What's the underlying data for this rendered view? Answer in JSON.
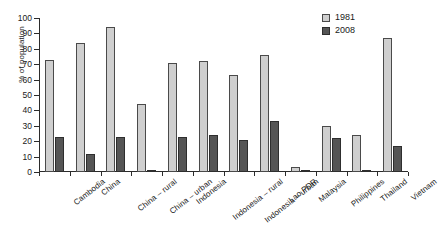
{
  "chart_data": {
    "type": "bar",
    "title": "",
    "xlabel": "",
    "ylabel": "% of population",
    "ylim": [
      0,
      100
    ],
    "ytick_step": 10,
    "grid": false,
    "legend_position": "top-right",
    "categories": [
      "Cambodia",
      "China",
      "China – rural",
      "China – urban",
      "Indonesia",
      "Indonesia – rural",
      "Indonesia – urban",
      "Lao PDR",
      "Malaysia",
      "Philippines",
      "Thailand",
      "Vietnam"
    ],
    "ytick_labels": [
      "0",
      "10",
      "20",
      "30",
      "40",
      "50",
      "60",
      "70",
      "80",
      "90",
      "100"
    ],
    "series": [
      {
        "name": "1981",
        "color": "#cfcfcf",
        "values": [
          73,
          84,
          94,
          44,
          71,
          72,
          63,
          76,
          3,
          30,
          24,
          87
        ]
      },
      {
        "name": "2008",
        "color": "#555555",
        "values": [
          23,
          12,
          23,
          1,
          23,
          24,
          21,
          33,
          0.5,
          22,
          0.5,
          17
        ]
      }
    ]
  }
}
